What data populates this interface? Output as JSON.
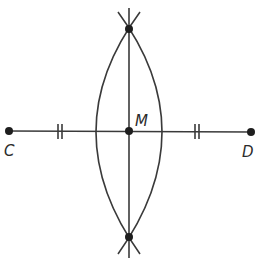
{
  "diagram": {
    "type": "perpendicular-bisector-construction",
    "colors": {
      "stroke": "#3a3a3a",
      "point": "#1e1e1e",
      "background": "#ffffff"
    },
    "points": [
      {
        "id": "C",
        "label": "C",
        "x": 9,
        "y": 131,
        "label_x": 4,
        "label_y": 156
      },
      {
        "id": "D",
        "label": "D",
        "x": 251,
        "y": 132,
        "label_x": 242,
        "label_y": 157
      },
      {
        "id": "M",
        "label": "M",
        "x": 129,
        "y": 131,
        "label_x": 135,
        "label_y": 126
      },
      {
        "id": "top",
        "label": "",
        "x": 129,
        "y": 29
      },
      {
        "id": "bottom",
        "label": "",
        "x": 129,
        "y": 237
      }
    ],
    "segments": [
      {
        "name": "CD",
        "from": "C",
        "to": "D"
      },
      {
        "name": "perpendicular-bisector",
        "x1": 129,
        "y1": 8,
        "x2": 129,
        "y2": 258
      }
    ],
    "congruence_marks": [
      {
        "segment": "CM",
        "x": 60,
        "y": 131,
        "count": 2
      },
      {
        "segment": "MD",
        "x": 197,
        "y": 131,
        "count": 2
      }
    ],
    "arcs": [
      {
        "name": "arc-from-D",
        "side": "left",
        "extreme_x": 90
      },
      {
        "name": "arc-from-C",
        "side": "right",
        "extreme_x": 168
      }
    ]
  }
}
